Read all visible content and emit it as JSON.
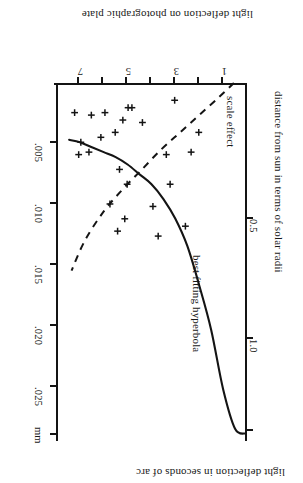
{
  "figure": {
    "orientation_note": "rotated-180",
    "background_color": "#ffffff",
    "ink_color": "#141414"
  },
  "chart_data": {
    "type": "scatter",
    "title": "",
    "xlabel": "distance from sun in terms of solar radii",
    "ylabel": "light deflection in seconds of arc",
    "y2label": "light deflection on photographic plate",
    "xlim": [
      0,
      8
    ],
    "ylim": [
      0,
      1.45
    ],
    "y2lim": [
      0,
      0.0295
    ],
    "grid": false,
    "xticks": [
      1,
      2,
      3,
      4,
      5,
      6,
      7
    ],
    "xticklabels": [
      "1",
      "",
      "3",
      "",
      "5",
      "",
      "7"
    ],
    "yticks": [
      0.5,
      1.0,
      1.45
    ],
    "yticklabels": [
      "0.5",
      "1.0",
      ""
    ],
    "y2ticks": [
      0.005,
      0.01,
      0.015,
      0.02,
      0.025,
      0.029
    ],
    "y2ticklabels": [
      ".005",
      ".010",
      ".015",
      ".020",
      ".025",
      "mm"
    ],
    "y2unit": "mm",
    "legend_position": "inline-annotations",
    "series": [
      {
        "name": "observed deflections",
        "type": "scatter",
        "marker": "plus",
        "points": [
          {
            "x": 2.02,
            "y": 0.2
          },
          {
            "x": 2.34,
            "y": 0.28
          },
          {
            "x": 2.58,
            "y": 0.58
          },
          {
            "x": 3.03,
            "y": 0.07
          },
          {
            "x": 3.22,
            "y": 0.41
          },
          {
            "x": 3.38,
            "y": 0.29
          },
          {
            "x": 3.72,
            "y": 0.62
          },
          {
            "x": 3.94,
            "y": 0.5
          },
          {
            "x": 4.38,
            "y": 0.16
          },
          {
            "x": 4.82,
            "y": 0.1
          },
          {
            "x": 4.98,
            "y": 0.1
          },
          {
            "x": 5.02,
            "y": 0.41
          },
          {
            "x": 5.12,
            "y": 0.55
          },
          {
            "x": 5.2,
            "y": 0.15
          },
          {
            "x": 5.34,
            "y": 0.35
          },
          {
            "x": 5.42,
            "y": 0.6
          },
          {
            "x": 5.52,
            "y": 0.2
          },
          {
            "x": 5.74,
            "y": 0.49
          },
          {
            "x": 5.95,
            "y": 0.12
          },
          {
            "x": 6.12,
            "y": 0.22
          },
          {
            "x": 6.52,
            "y": 0.13
          },
          {
            "x": 6.62,
            "y": 0.28
          },
          {
            "x": 6.96,
            "y": 0.24
          },
          {
            "x": 7.05,
            "y": 0.29
          },
          {
            "x": 7.22,
            "y": 0.12
          }
        ]
      },
      {
        "name": "best fitting hyperbola",
        "type": "line",
        "style": "solid",
        "annotation": "best fitting hyperbola",
        "points": [
          {
            "x": 0.05,
            "y": 1.42
          },
          {
            "x": 0.5,
            "y": 1.4
          },
          {
            "x": 1.0,
            "y": 1.24
          },
          {
            "x": 1.5,
            "y": 1.0
          },
          {
            "x": 2.0,
            "y": 0.82
          },
          {
            "x": 2.5,
            "y": 0.66
          },
          {
            "x": 3.0,
            "y": 0.55
          },
          {
            "x": 3.5,
            "y": 0.47
          },
          {
            "x": 4.0,
            "y": 0.41
          },
          {
            "x": 4.5,
            "y": 0.37
          },
          {
            "x": 5.0,
            "y": 0.33
          },
          {
            "x": 5.5,
            "y": 0.3
          },
          {
            "x": 6.0,
            "y": 0.28
          },
          {
            "x": 6.5,
            "y": 0.26
          },
          {
            "x": 7.0,
            "y": 0.24
          },
          {
            "x": 7.45,
            "y": 0.23
          }
        ]
      },
      {
        "name": "scale effect",
        "type": "line",
        "style": "dashed",
        "annotation": "scale effect",
        "points": [
          {
            "x": 0.55,
            "y": 0.0
          },
          {
            "x": 1.2,
            "y": 0.06
          },
          {
            "x": 2.0,
            "y": 0.13
          },
          {
            "x": 2.8,
            "y": 0.2
          },
          {
            "x": 3.6,
            "y": 0.27
          },
          {
            "x": 4.4,
            "y": 0.35
          },
          {
            "x": 5.2,
            "y": 0.43
          },
          {
            "x": 6.0,
            "y": 0.52
          },
          {
            "x": 6.8,
            "y": 0.64
          },
          {
            "x": 7.35,
            "y": 0.76
          }
        ]
      }
    ]
  },
  "labels": {
    "top_axis_title": "light deflection on photographic plate",
    "bottom_axis_title": "light deflection in seconds of arc",
    "right_axis_title": "distance from sun in terms of solar radii",
    "hyperbola_annotation": "best fitting hyperbola",
    "scale_effect_annotation": "scale effect",
    "mm_unit": "mm",
    "mm_t1": ".005",
    "mm_t2": ".010",
    "mm_t3": ".015",
    "mm_t4": ".020",
    "mm_t5": ".025",
    "arc_t1": "0.5",
    "arc_t2": "1.0",
    "radii_t1": "1",
    "radii_t3": "3",
    "radii_t5": "5",
    "radii_t7": "7"
  }
}
